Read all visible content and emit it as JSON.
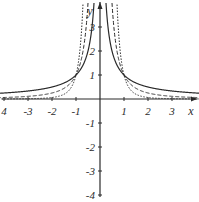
{
  "chart_data": {
    "type": "line",
    "title": "",
    "xlabel": "x",
    "ylabel": "y",
    "xlim": [
      -4.2,
      4.1
    ],
    "ylim": [
      -4,
      4.1
    ],
    "grid": false,
    "legend": null,
    "x_ticks": [
      -4,
      -3,
      -2,
      -1,
      1,
      2,
      3
    ],
    "x_tick_labels": [
      "4",
      "-3",
      "-2",
      "-1",
      "1",
      "2",
      "3"
    ],
    "y_ticks": [
      -4,
      -3,
      -2,
      -1,
      1,
      2,
      3
    ],
    "y_tick_labels": [
      "-4",
      "-3",
      "-2",
      "-1",
      "1",
      "2",
      "3"
    ],
    "series": [
      {
        "name": "y = 1/|x|",
        "style": "solid",
        "exponent": 1
      },
      {
        "name": "y = 1/x^2",
        "style": "dashed",
        "exponent": 2
      },
      {
        "name": "y = 1/x^4",
        "style": "dotted",
        "exponent": 4
      }
    ],
    "annotations": [
      "All curves pass through (-1, 1) and (1, 1)"
    ],
    "caption_partial": "cut-off text at bottom edge"
  },
  "colors": {
    "axis": "#2b2b2b",
    "curve": "#2b2b2b",
    "background": "#ffffff"
  }
}
